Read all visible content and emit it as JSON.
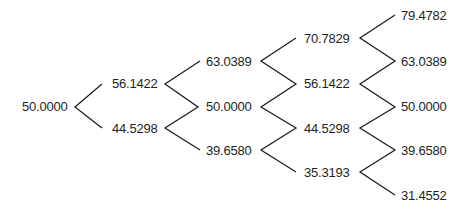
{
  "diagram": {
    "type": "binomial-tree",
    "steps": 4,
    "line_color": "#231f20",
    "levels": [
      {
        "step": 0,
        "nodes": [
          "50.0000"
        ]
      },
      {
        "step": 1,
        "nodes": [
          "56.1422",
          "44.5298"
        ]
      },
      {
        "step": 2,
        "nodes": [
          "63.0389",
          "50.0000",
          "39.6580"
        ]
      },
      {
        "step": 3,
        "nodes": [
          "70.7829",
          "56.1422",
          "44.5298",
          "35.3193"
        ]
      },
      {
        "step": 4,
        "nodes": [
          "79.4782",
          "63.0389",
          "50.0000",
          "39.6580",
          "31.4552"
        ]
      }
    ]
  }
}
